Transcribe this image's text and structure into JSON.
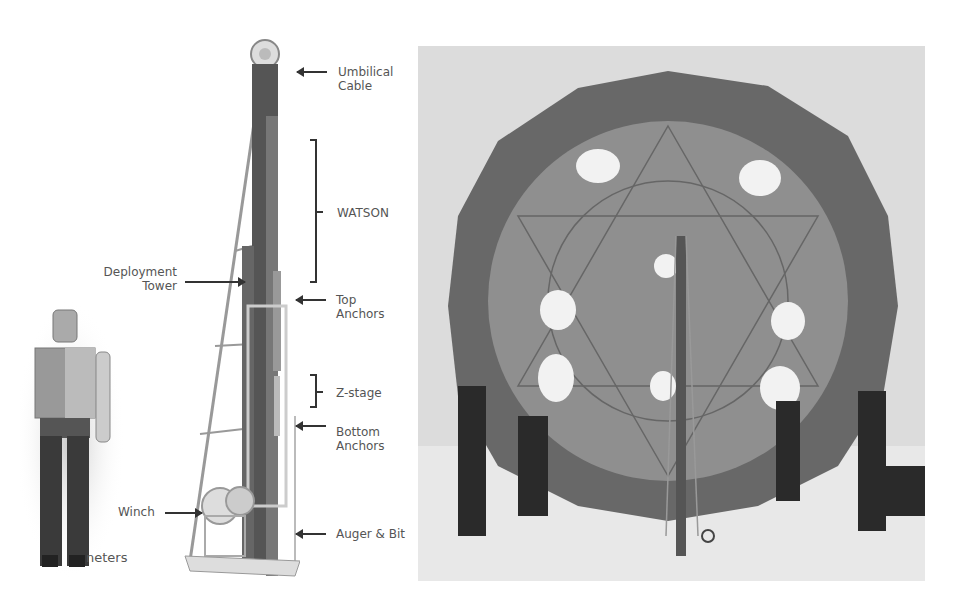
{
  "figure": {
    "left_panel": {
      "title": "Drill deployment tower diagram",
      "labels": {
        "umbilical_cable": "Umbilical\nCable",
        "watson": "WATSON",
        "deployment_tower": "Deployment\nTower",
        "top_anchors": "Top\nAnchors",
        "z_stage": "Z-stage",
        "bottom_anchors": "Bottom\nAnchors",
        "winch": "Winch",
        "auger_bit": "Auger & Bit",
        "scale_partial": "neters"
      }
    },
    "right_panel": {
      "description": "Field photo: five people holding up a large round geodesic fabric cover over a drill tower on snow"
    },
    "colors": {
      "background": "#ffffff",
      "label_text": "#555555",
      "arrow": "#333333",
      "snow": "#e2e2e2",
      "dome_outer": "#6a6a6a",
      "dome_inner": "#8e8e8e"
    }
  }
}
